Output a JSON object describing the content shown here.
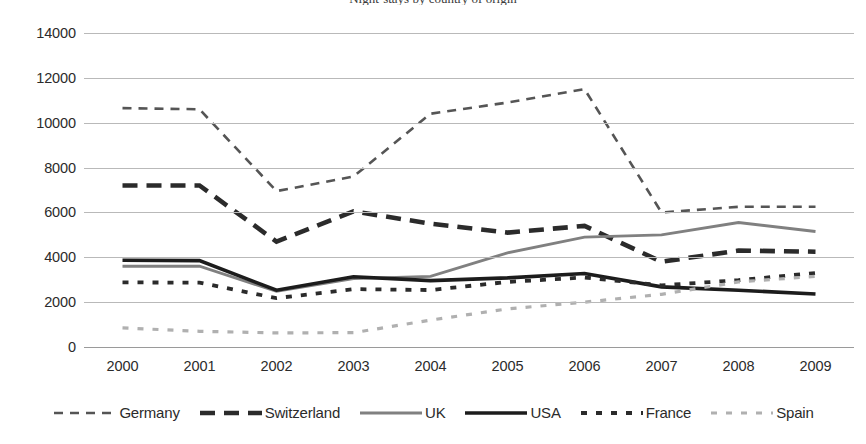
{
  "chart_data": {
    "type": "line",
    "title": "Night-stays by country of origin",
    "xlabel": "",
    "ylabel": "",
    "x": [
      2000,
      2001,
      2002,
      2003,
      2004,
      2005,
      2006,
      2007,
      2008,
      2009
    ],
    "categories": [
      "2000",
      "2001",
      "2002",
      "2003",
      "2004",
      "2005",
      "2006",
      "2007",
      "2008",
      "2009"
    ],
    "ylim": [
      0,
      14000
    ],
    "ytick_step": 2000,
    "yticks": [
      "14000",
      "12000",
      "10000",
      "8000",
      "6000",
      "4000",
      "2000",
      "0"
    ],
    "grid": "horizontal",
    "legend_position": "bottom",
    "series": [
      {
        "name": "Germany",
        "style": "dashed",
        "color": "#555555",
        "width": 2.6,
        "dash": "9,7",
        "values": [
          10650,
          10600,
          6950,
          7600,
          10400,
          10900,
          11500,
          6000,
          6250,
          6250
        ]
      },
      {
        "name": "Switzerland",
        "style": "dashed-bold",
        "color": "#2b2b2b",
        "width": 4.6,
        "dash": "15,9",
        "values": [
          7200,
          7200,
          4700,
          6050,
          5500,
          5100,
          5400,
          3800,
          4300,
          4250
        ]
      },
      {
        "name": "UK",
        "style": "solid",
        "color": "#808080",
        "width": 2.8,
        "dash": "none",
        "values": [
          3600,
          3600,
          2480,
          3050,
          3150,
          4200,
          4900,
          5000,
          5550,
          5150
        ]
      },
      {
        "name": "USA",
        "style": "solid-bold",
        "color": "#1c1c1c",
        "width": 3.6,
        "dash": "none",
        "values": [
          3870,
          3850,
          2530,
          3130,
          2960,
          3080,
          3280,
          2680,
          2530,
          2360
        ]
      },
      {
        "name": "France",
        "style": "dotted-bold",
        "color": "#2b2b2b",
        "width": 3.8,
        "dash": "6,9",
        "values": [
          2880,
          2870,
          2180,
          2580,
          2540,
          2900,
          3100,
          2750,
          2980,
          3300
        ]
      },
      {
        "name": "Spain",
        "style": "dotted-light",
        "color": "#b0b0b0",
        "width": 3.2,
        "dash": "6,9",
        "values": [
          850,
          700,
          630,
          640,
          1200,
          1700,
          2000,
          2350,
          2900,
          3150
        ]
      }
    ]
  },
  "legend": {
    "items": [
      {
        "label": "Germany"
      },
      {
        "label": "Switzerland"
      },
      {
        "label": "UK"
      },
      {
        "label": "USA"
      },
      {
        "label": "France"
      },
      {
        "label": "Spain"
      }
    ]
  }
}
